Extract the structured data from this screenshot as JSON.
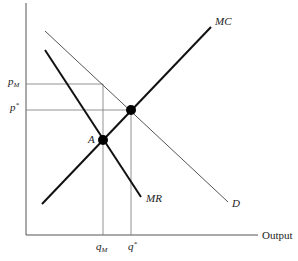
{
  "diagram": {
    "type": "monopoly pricing diagram",
    "curves": {
      "mc": {
        "label": "MC",
        "x1": 42,
        "y1": 204,
        "x2": 211,
        "y2": 27
      },
      "mr": {
        "label": "MR",
        "x1": 45,
        "y1": 50,
        "x2": 141,
        "y2": 197
      },
      "demand": {
        "label": "D",
        "x1": 45,
        "y1": 31,
        "x2": 228,
        "y2": 202
      }
    },
    "points": {
      "a": {
        "label": "A",
        "x": 103,
        "y": 140
      },
      "competitive": {
        "label": "",
        "x": 131,
        "y": 110
      }
    },
    "axis": {
      "x_label": "Output",
      "origin_x": 26,
      "origin_y": 235,
      "x_end": 258,
      "y_top": 3
    },
    "price_labels": {
      "pm": {
        "base": "p",
        "sub": "M"
      },
      "pstar": {
        "base": "p",
        "sup": "*"
      }
    },
    "quantity_labels": {
      "qm": {
        "base": "q",
        "sub": "M"
      },
      "qstar": {
        "base": "q",
        "sup": "*"
      }
    },
    "colors": {
      "thick": "#111111",
      "thin": "#555555",
      "guide": "#777777"
    }
  }
}
